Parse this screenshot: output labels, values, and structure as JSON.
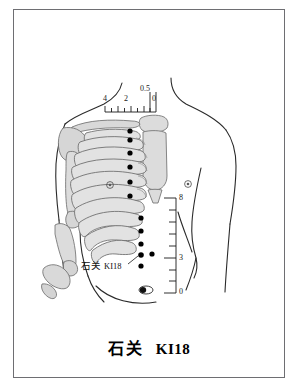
{
  "figure": {
    "title_cn": "石关",
    "title_code": "KI18",
    "point_label_cn": "石关",
    "point_label_code": "KI18",
    "colors": {
      "frame": "#6e6e72",
      "ink": "#1a1a1a",
      "bone_fill": "#d9d9d9",
      "bone_stroke": "#6a6a6a",
      "outline": "#2a2a2a",
      "point_fill": "#000000"
    }
  },
  "horizontal_ruler": {
    "name": "cun-scale-horizontal",
    "labels": [
      "4",
      "2",
      "0.5",
      "0"
    ],
    "tick_count": 9,
    "unit": "cun"
  },
  "vertical_ruler": {
    "name": "cun-scale-vertical",
    "labels": [
      "8",
      "3",
      "0"
    ],
    "tick_count": 9,
    "unit": "cun"
  },
  "acupoints": {
    "midline_points_count": 13,
    "lateral_point_count": 1,
    "landmarks": [
      "left-nipple",
      "right-nipple",
      "umbilicus"
    ]
  }
}
